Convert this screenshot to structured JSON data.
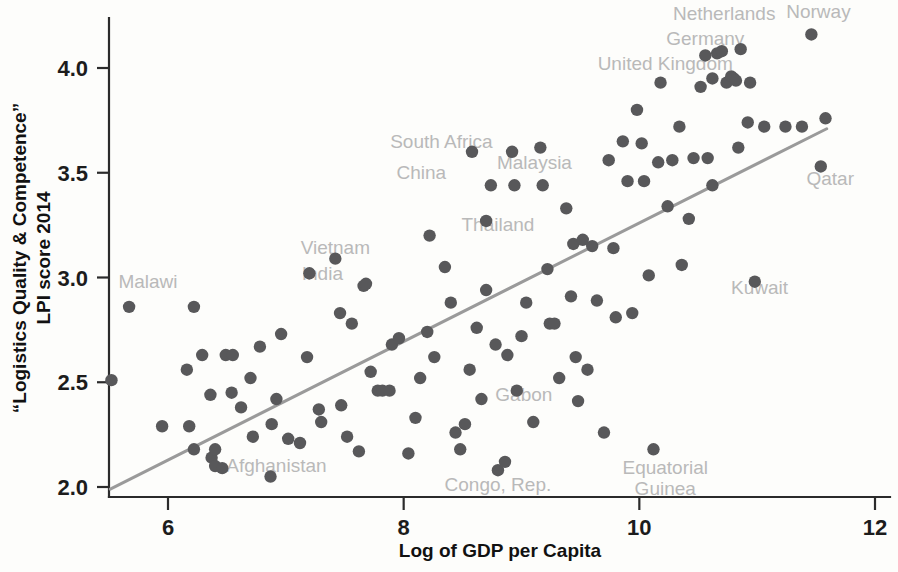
{
  "chart_data": {
    "type": "scatter",
    "title": "",
    "xlabel": "Log of GDP per Capita",
    "ylabel": "“Logistics Quality & Competence” LPI score 2014",
    "ylabel_line1": "“Logistics Quality & Competence”",
    "ylabel_line2": "LPI score 2014",
    "xlim": [
      5.45,
      12.15
    ],
    "ylim": [
      1.93,
      4.25
    ],
    "xticks": [
      6,
      8,
      10,
      12
    ],
    "xtick_labels": [
      "6",
      "8",
      "10",
      "12"
    ],
    "yticks": [
      2.0,
      2.5,
      3.0,
      3.5,
      4.0
    ],
    "ytick_labels": [
      "2.0",
      "2.5",
      "3.0",
      "3.5",
      "4.0"
    ],
    "grid": false,
    "legend": "none",
    "marker_color": "#58585a",
    "label_color": "#b9b9b9",
    "axis_color": "#2b2b2b",
    "trend_color": "#9a9a9a",
    "trendline": {
      "type": "linear",
      "x_start": 5.51,
      "y_start": 1.99,
      "x_end": 11.59,
      "y_end": 3.71
    },
    "annotations": [
      {
        "label": "Netherlands",
        "x": 10.72,
        "y": 4.23,
        "anchor": "middle"
      },
      {
        "label": "Norway",
        "x": 11.52,
        "y": 4.24,
        "anchor": "middle"
      },
      {
        "label": "Germany",
        "x": 10.56,
        "y": 4.11,
        "anchor": "middle"
      },
      {
        "label": "United Kingdom",
        "x": 10.22,
        "y": 3.99,
        "anchor": "middle"
      },
      {
        "label": "South Africa",
        "x": 8.32,
        "y": 3.62,
        "anchor": "middle"
      },
      {
        "label": "Malaysia",
        "x": 9.11,
        "y": 3.52,
        "anchor": "middle"
      },
      {
        "label": "China",
        "x": 8.15,
        "y": 3.47,
        "anchor": "middle"
      },
      {
        "label": "Qatar",
        "x": 11.62,
        "y": 3.44,
        "anchor": "middle"
      },
      {
        "label": "Thailand",
        "x": 8.8,
        "y": 3.22,
        "anchor": "middle"
      },
      {
        "label": "Vietnam",
        "x": 7.42,
        "y": 3.11,
        "anchor": "middle"
      },
      {
        "label": "Kuwait",
        "x": 11.02,
        "y": 2.92,
        "anchor": "middle"
      },
      {
        "label": "India",
        "x": 7.31,
        "y": 2.99,
        "anchor": "middle"
      },
      {
        "label": "Malawi",
        "x": 5.83,
        "y": 2.95,
        "anchor": "middle"
      },
      {
        "label": "Gabon",
        "x": 9.02,
        "y": 2.41,
        "anchor": "middle"
      },
      {
        "label": "Afghanistan",
        "x": 6.92,
        "y": 2.07,
        "anchor": "middle"
      },
      {
        "label": "Equatorial",
        "x": 10.22,
        "y": 2.06,
        "anchor": "middle"
      },
      {
        "label": "Congo, Rep.",
        "x": 8.8,
        "y": 1.98,
        "anchor": "middle"
      },
      {
        "label": "Guinea",
        "x": 10.22,
        "y": 1.96,
        "anchor": "middle"
      }
    ],
    "points": [
      {
        "x": 5.52,
        "y": 2.51
      },
      {
        "x": 5.67,
        "y": 2.86
      },
      {
        "x": 6.22,
        "y": 2.86
      },
      {
        "x": 5.95,
        "y": 2.29
      },
      {
        "x": 6.18,
        "y": 2.29
      },
      {
        "x": 6.22,
        "y": 2.18
      },
      {
        "x": 6.37,
        "y": 2.14
      },
      {
        "x": 6.4,
        "y": 2.18
      },
      {
        "x": 6.4,
        "y": 2.1
      },
      {
        "x": 6.46,
        "y": 2.09
      },
      {
        "x": 6.29,
        "y": 2.63
      },
      {
        "x": 6.16,
        "y": 2.56
      },
      {
        "x": 6.49,
        "y": 2.63
      },
      {
        "x": 6.55,
        "y": 2.63
      },
      {
        "x": 6.36,
        "y": 2.44
      },
      {
        "x": 6.54,
        "y": 2.45
      },
      {
        "x": 6.62,
        "y": 2.38
      },
      {
        "x": 6.7,
        "y": 2.52
      },
      {
        "x": 6.78,
        "y": 2.67
      },
      {
        "x": 6.88,
        "y": 2.3
      },
      {
        "x": 6.72,
        "y": 2.24
      },
      {
        "x": 6.87,
        "y": 2.05
      },
      {
        "x": 6.96,
        "y": 2.73
      },
      {
        "x": 6.92,
        "y": 2.42
      },
      {
        "x": 7.02,
        "y": 2.23
      },
      {
        "x": 7.12,
        "y": 2.21
      },
      {
        "x": 7.2,
        "y": 3.02
      },
      {
        "x": 7.18,
        "y": 2.62
      },
      {
        "x": 7.28,
        "y": 2.37
      },
      {
        "x": 7.3,
        "y": 2.31
      },
      {
        "x": 7.42,
        "y": 3.09
      },
      {
        "x": 7.46,
        "y": 2.83
      },
      {
        "x": 7.47,
        "y": 2.39
      },
      {
        "x": 7.52,
        "y": 2.24
      },
      {
        "x": 7.62,
        "y": 2.17
      },
      {
        "x": 7.56,
        "y": 2.78
      },
      {
        "x": 7.66,
        "y": 2.96
      },
      {
        "x": 7.68,
        "y": 2.97
      },
      {
        "x": 7.72,
        "y": 2.55
      },
      {
        "x": 7.78,
        "y": 2.46
      },
      {
        "x": 7.82,
        "y": 2.46
      },
      {
        "x": 7.88,
        "y": 2.46
      },
      {
        "x": 7.9,
        "y": 2.68
      },
      {
        "x": 7.96,
        "y": 2.71
      },
      {
        "x": 8.04,
        "y": 2.16
      },
      {
        "x": 8.1,
        "y": 2.33
      },
      {
        "x": 8.14,
        "y": 2.52
      },
      {
        "x": 8.2,
        "y": 2.74
      },
      {
        "x": 8.22,
        "y": 3.2
      },
      {
        "x": 8.26,
        "y": 2.62
      },
      {
        "x": 8.35,
        "y": 3.05
      },
      {
        "x": 8.4,
        "y": 2.88
      },
      {
        "x": 8.44,
        "y": 2.26
      },
      {
        "x": 8.48,
        "y": 2.18
      },
      {
        "x": 8.52,
        "y": 2.3
      },
      {
        "x": 8.58,
        "y": 3.6
      },
      {
        "x": 8.56,
        "y": 2.56
      },
      {
        "x": 8.62,
        "y": 2.76
      },
      {
        "x": 8.66,
        "y": 2.42
      },
      {
        "x": 8.7,
        "y": 3.27
      },
      {
        "x": 8.7,
        "y": 2.94
      },
      {
        "x": 8.74,
        "y": 3.44
      },
      {
        "x": 8.78,
        "y": 2.68
      },
      {
        "x": 8.8,
        "y": 2.08
      },
      {
        "x": 8.86,
        "y": 2.12
      },
      {
        "x": 8.88,
        "y": 2.63
      },
      {
        "x": 8.92,
        "y": 3.6
      },
      {
        "x": 8.94,
        "y": 3.44
      },
      {
        "x": 8.96,
        "y": 2.46
      },
      {
        "x": 9.0,
        "y": 2.72
      },
      {
        "x": 9.04,
        "y": 2.88
      },
      {
        "x": 9.1,
        "y": 2.31
      },
      {
        "x": 9.16,
        "y": 3.62
      },
      {
        "x": 9.18,
        "y": 3.44
      },
      {
        "x": 9.22,
        "y": 3.04
      },
      {
        "x": 9.24,
        "y": 2.78
      },
      {
        "x": 9.28,
        "y": 2.78
      },
      {
        "x": 9.32,
        "y": 2.52
      },
      {
        "x": 9.38,
        "y": 3.33
      },
      {
        "x": 9.42,
        "y": 2.91
      },
      {
        "x": 9.44,
        "y": 3.16
      },
      {
        "x": 9.46,
        "y": 2.62
      },
      {
        "x": 9.48,
        "y": 2.41
      },
      {
        "x": 9.52,
        "y": 3.18
      },
      {
        "x": 9.56,
        "y": 2.56
      },
      {
        "x": 9.6,
        "y": 3.15
      },
      {
        "x": 9.64,
        "y": 2.89
      },
      {
        "x": 9.7,
        "y": 2.26
      },
      {
        "x": 9.74,
        "y": 3.56
      },
      {
        "x": 9.78,
        "y": 3.14
      },
      {
        "x": 9.8,
        "y": 2.81
      },
      {
        "x": 9.86,
        "y": 3.65
      },
      {
        "x": 9.9,
        "y": 3.46
      },
      {
        "x": 9.94,
        "y": 2.83
      },
      {
        "x": 9.98,
        "y": 3.8
      },
      {
        "x": 10.02,
        "y": 3.64
      },
      {
        "x": 10.04,
        "y": 3.46
      },
      {
        "x": 10.08,
        "y": 3.01
      },
      {
        "x": 10.12,
        "y": 2.18
      },
      {
        "x": 10.16,
        "y": 3.55
      },
      {
        "x": 10.18,
        "y": 3.93
      },
      {
        "x": 10.24,
        "y": 3.34
      },
      {
        "x": 10.28,
        "y": 3.56
      },
      {
        "x": 10.34,
        "y": 3.72
      },
      {
        "x": 10.36,
        "y": 3.06
      },
      {
        "x": 10.42,
        "y": 3.28
      },
      {
        "x": 10.46,
        "y": 3.57
      },
      {
        "x": 10.52,
        "y": 3.91
      },
      {
        "x": 10.58,
        "y": 3.57
      },
      {
        "x": 10.62,
        "y": 3.44
      },
      {
        "x": 10.66,
        "y": 4.07
      },
      {
        "x": 10.7,
        "y": 4.08
      },
      {
        "x": 10.74,
        "y": 3.93
      },
      {
        "x": 10.78,
        "y": 3.96
      },
      {
        "x": 10.8,
        "y": 3.95
      },
      {
        "x": 10.82,
        "y": 3.94
      },
      {
        "x": 10.86,
        "y": 4.09
      },
      {
        "x": 10.84,
        "y": 3.62
      },
      {
        "x": 10.92,
        "y": 3.74
      },
      {
        "x": 10.94,
        "y": 3.93
      },
      {
        "x": 10.98,
        "y": 2.98
      },
      {
        "x": 11.06,
        "y": 3.72
      },
      {
        "x": 11.24,
        "y": 3.72
      },
      {
        "x": 11.38,
        "y": 3.72
      },
      {
        "x": 11.46,
        "y": 4.16
      },
      {
        "x": 11.54,
        "y": 3.53
      },
      {
        "x": 11.58,
        "y": 3.76
      },
      {
        "x": 10.62,
        "y": 3.95
      },
      {
        "x": 10.56,
        "y": 4.06
      }
    ]
  }
}
